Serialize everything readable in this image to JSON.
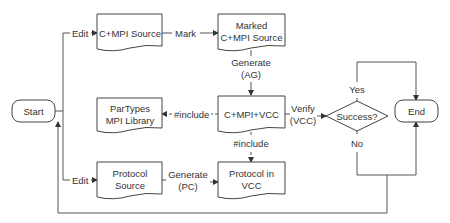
{
  "diagram": {
    "type": "flowchart",
    "nodes": {
      "start": {
        "label": "Start",
        "shape": "terminator"
      },
      "cmpi_source": {
        "label": "C+MPI Source",
        "shape": "document"
      },
      "marked_source": {
        "lines": [
          "Marked",
          "C+MPI Source"
        ],
        "shape": "document"
      },
      "partypes": {
        "lines": [
          "ParTypes",
          "MPI Library"
        ],
        "shape": "document"
      },
      "cmpi_vcc": {
        "label": "C+MPI+VCC",
        "shape": "document"
      },
      "protocol_source": {
        "lines": [
          "Protocol",
          "Source"
        ],
        "shape": "document"
      },
      "protocol_vcc": {
        "lines": [
          "Protocol in",
          "VCC"
        ],
        "shape": "document"
      },
      "success": {
        "label": "Success?",
        "shape": "decision"
      },
      "end": {
        "label": "End",
        "shape": "terminator"
      }
    },
    "edges": {
      "edit_top": {
        "label": "Edit",
        "from": "start",
        "to": "cmpi_source",
        "style": "solid"
      },
      "mark": {
        "label": "Mark",
        "from": "cmpi_source",
        "to": "marked_source",
        "style": "solid"
      },
      "generate_ag": {
        "lines": [
          "Generate",
          "(AG)"
        ],
        "from": "marked_source",
        "to": "cmpi_vcc",
        "style": "solid"
      },
      "include_left": {
        "label": "#include",
        "from": "cmpi_vcc",
        "to": "partypes",
        "style": "dashed"
      },
      "include_down": {
        "label": "#include",
        "from": "cmpi_vcc",
        "to": "protocol_vcc",
        "style": "dashed"
      },
      "verify": {
        "lines": [
          "Verify",
          "(VCC)"
        ],
        "from": "cmpi_vcc",
        "to": "success",
        "style": "solid"
      },
      "yes": {
        "label": "Yes",
        "from": "success",
        "to": "end",
        "style": "solid"
      },
      "no": {
        "label": "No",
        "from": "success",
        "to": "end",
        "style": "solid"
      },
      "edit_bottom": {
        "label": "Edit",
        "from": "start",
        "to": "protocol_source",
        "style": "solid"
      },
      "generate_pc": {
        "lines": [
          "Generate",
          "(PC)"
        ],
        "from": "protocol_source",
        "to": "protocol_vcc",
        "style": "solid"
      },
      "loop_back": {
        "label": "",
        "from": "no-branch",
        "to": "start",
        "style": "solid"
      }
    }
  }
}
